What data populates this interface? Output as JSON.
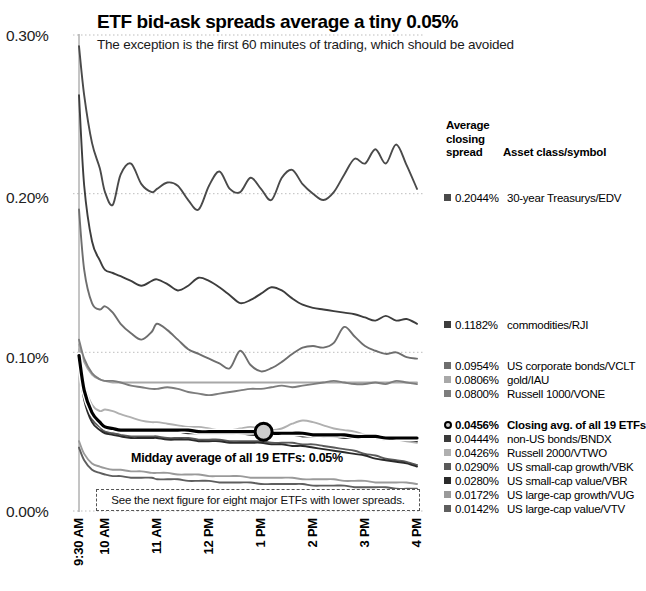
{
  "header": {
    "title": "ETF bid-ask spreads average a tiny 0.05%",
    "subtitle": "The exception is the first 60 minutes of trading, which should be avoided"
  },
  "annotations": {
    "midday": "Midday average of all 19 ETFs: 0.05%",
    "note": "See the next figure for eight major ETFs with lower spreads."
  },
  "legend": {
    "head_line1": "Average",
    "head_line2": "closing",
    "head_line3": "spread",
    "head_col2": "Asset class/symbol",
    "rows": [
      {
        "value": "0.2044%",
        "label": "30-year Treasurys/EDV",
        "color": "#4a4a4a",
        "marker": "square",
        "bold": false,
        "top": 191
      },
      {
        "value": "0.1182%",
        "label": "commodities/RJI",
        "color": "#3d3d3d",
        "marker": "square",
        "bold": false,
        "top": 318
      },
      {
        "value": "0.0954%",
        "label": "US corporate bonds/VCLT",
        "color": "#6e6e6e",
        "marker": "square",
        "bold": false,
        "top": 359
      },
      {
        "value": "0.0806%",
        "label": "gold/IAU",
        "color": "#a8a8a8",
        "marker": "square",
        "bold": false,
        "top": 373
      },
      {
        "value": "0.0800%",
        "label": "Russell 1000/VONE",
        "color": "#7d7d7d",
        "marker": "square",
        "bold": false,
        "top": 387
      },
      {
        "value": "0.0456%",
        "label": "Closing avg. of all 19 ETFs",
        "color": "#000000",
        "marker": "ring",
        "bold": true,
        "top": 418
      },
      {
        "value": "0.0444%",
        "label": "non-US bonds/BNDX",
        "color": "#3a3a3a",
        "marker": "square",
        "bold": false,
        "top": 432
      },
      {
        "value": "0.0426%",
        "label": "Russell 2000/VTWO",
        "color": "#b0b0b0",
        "marker": "square",
        "bold": false,
        "top": 446
      },
      {
        "value": "0.0290%",
        "label": "US small-cap growth/VBK",
        "color": "#5a5a5a",
        "marker": "square",
        "bold": false,
        "top": 460
      },
      {
        "value": "0.0280%",
        "label": "US small-cap value/VBR",
        "color": "#2a2a2a",
        "marker": "square",
        "bold": false,
        "top": 474
      },
      {
        "value": "0.0172%",
        "label": "US large-cap growth/VUG",
        "color": "#9a9a9a",
        "marker": "square",
        "bold": false,
        "top": 488
      },
      {
        "value": "0.0142%",
        "label": "US large-cap value/VTV",
        "color": "#5e5e5e",
        "marker": "square",
        "bold": false,
        "top": 502
      }
    ]
  },
  "chart_data": {
    "type": "line",
    "title": "ETF bid-ask spreads average a tiny 0.05%",
    "subtitle": "The exception is the first 60 minutes of trading, which should be avoided",
    "xlabel": "",
    "ylabel": "",
    "ylim": [
      0.0,
      0.3
    ],
    "yticks": [
      "0.00%",
      "0.10%",
      "0.20%",
      "0.30%"
    ],
    "ytick_values": [
      0.0,
      0.1,
      0.2,
      0.3
    ],
    "xticks": [
      "9:30 AM",
      "10 AM",
      "11 AM",
      "12 PM",
      "1 PM",
      "2 PM",
      "3 PM",
      "4 PM"
    ],
    "xtick_hours": [
      9.5,
      10,
      11,
      12,
      13,
      14,
      15,
      16
    ],
    "grid": "dotted-horizontal",
    "legend_position": "right",
    "x": [
      9.5,
      9.6,
      9.75,
      9.9,
      10.0,
      10.15,
      10.3,
      10.5,
      10.7,
      10.9,
      11.0,
      11.2,
      11.4,
      11.6,
      11.8,
      12.0,
      12.2,
      12.4,
      12.6,
      12.8,
      13.0,
      13.2,
      13.4,
      13.6,
      13.8,
      14.0,
      14.2,
      14.4,
      14.6,
      14.8,
      15.0,
      15.2,
      15.4,
      15.6,
      15.8,
      16.0
    ],
    "series": [
      {
        "name": "30-year Treasurys/EDV",
        "symbol": "EDV",
        "color": "#4a4a4a",
        "closing_avg": 0.2044,
        "values": [
          0.293,
          0.262,
          0.232,
          0.216,
          0.201,
          0.193,
          0.212,
          0.219,
          0.206,
          0.201,
          0.203,
          0.207,
          0.205,
          0.196,
          0.19,
          0.205,
          0.214,
          0.203,
          0.201,
          0.21,
          0.203,
          0.196,
          0.21,
          0.215,
          0.206,
          0.2,
          0.196,
          0.201,
          0.212,
          0.222,
          0.219,
          0.228,
          0.219,
          0.231,
          0.218,
          0.203
        ]
      },
      {
        "name": "commodities/RJI",
        "symbol": "RJI",
        "color": "#3d3d3d",
        "closing_avg": 0.1182,
        "values": [
          0.262,
          0.205,
          0.17,
          0.158,
          0.152,
          0.15,
          0.148,
          0.145,
          0.142,
          0.145,
          0.146,
          0.143,
          0.139,
          0.142,
          0.147,
          0.145,
          0.141,
          0.136,
          0.131,
          0.133,
          0.137,
          0.141,
          0.139,
          0.134,
          0.13,
          0.128,
          0.127,
          0.126,
          0.125,
          0.124,
          0.122,
          0.12,
          0.123,
          0.12,
          0.121,
          0.118
        ]
      },
      {
        "name": "US corporate bonds/VCLT",
        "symbol": "VCLT",
        "color": "#6e6e6e",
        "closing_avg": 0.0954,
        "values": [
          0.19,
          0.152,
          0.131,
          0.127,
          0.129,
          0.125,
          0.118,
          0.112,
          0.108,
          0.113,
          0.118,
          0.114,
          0.108,
          0.102,
          0.099,
          0.096,
          0.093,
          0.09,
          0.101,
          0.092,
          0.088,
          0.09,
          0.094,
          0.099,
          0.103,
          0.104,
          0.103,
          0.106,
          0.116,
          0.11,
          0.104,
          0.101,
          0.099,
          0.1,
          0.097,
          0.096
        ]
      },
      {
        "name": "gold/IAU",
        "symbol": "IAU",
        "color": "#a8a8a8",
        "closing_avg": 0.0806,
        "values": [
          0.105,
          0.094,
          0.086,
          0.083,
          0.082,
          0.081,
          0.081,
          0.081,
          0.081,
          0.081,
          0.081,
          0.081,
          0.081,
          0.081,
          0.081,
          0.081,
          0.081,
          0.081,
          0.081,
          0.081,
          0.081,
          0.081,
          0.081,
          0.081,
          0.081,
          0.081,
          0.081,
          0.081,
          0.081,
          0.081,
          0.081,
          0.081,
          0.081,
          0.081,
          0.081,
          0.081
        ]
      },
      {
        "name": "Russell 1000/VONE",
        "symbol": "VONE",
        "color": "#7d7d7d",
        "closing_avg": 0.08,
        "values": [
          0.108,
          0.096,
          0.087,
          0.083,
          0.082,
          0.082,
          0.081,
          0.079,
          0.078,
          0.077,
          0.077,
          0.078,
          0.077,
          0.075,
          0.074,
          0.073,
          0.074,
          0.075,
          0.076,
          0.077,
          0.077,
          0.078,
          0.079,
          0.078,
          0.079,
          0.08,
          0.081,
          0.082,
          0.081,
          0.08,
          0.08,
          0.081,
          0.08,
          0.082,
          0.081,
          0.08
        ]
      },
      {
        "name": "Closing avg. of all 19 ETFs",
        "symbol": "AVG19",
        "color": "#000000",
        "closing_avg": 0.0456,
        "values": [
          0.098,
          0.076,
          0.062,
          0.056,
          0.053,
          0.052,
          0.051,
          0.051,
          0.051,
          0.051,
          0.051,
          0.051,
          0.051,
          0.051,
          0.05,
          0.05,
          0.05,
          0.05,
          0.05,
          0.05,
          0.05,
          0.049,
          0.049,
          0.049,
          0.049,
          0.048,
          0.048,
          0.048,
          0.048,
          0.047,
          0.047,
          0.047,
          0.046,
          0.046,
          0.046,
          0.046
        ]
      },
      {
        "name": "non-US bonds/BNDX",
        "symbol": "BNDX",
        "color": "#3a3a3a",
        "closing_avg": 0.0444,
        "values": [
          0.096,
          0.074,
          0.06,
          0.055,
          0.052,
          0.051,
          0.05,
          0.05,
          0.05,
          0.05,
          0.05,
          0.05,
          0.05,
          0.049,
          0.049,
          0.049,
          0.049,
          0.049,
          0.049,
          0.048,
          0.048,
          0.048,
          0.048,
          0.048,
          0.047,
          0.047,
          0.047,
          0.047,
          0.046,
          0.046,
          0.046,
          0.046,
          0.045,
          0.045,
          0.045,
          0.044
        ]
      },
      {
        "name": "Russell 2000/VTWO",
        "symbol": "VTWO",
        "color": "#b0b0b0",
        "closing_avg": 0.0426,
        "values": [
          0.102,
          0.08,
          0.067,
          0.063,
          0.064,
          0.063,
          0.061,
          0.059,
          0.057,
          0.056,
          0.056,
          0.055,
          0.054,
          0.053,
          0.053,
          0.052,
          0.051,
          0.051,
          0.052,
          0.053,
          0.052,
          0.051,
          0.052,
          0.055,
          0.057,
          0.056,
          0.054,
          0.052,
          0.051,
          0.05,
          0.048,
          0.047,
          0.046,
          0.045,
          0.044,
          0.043
        ]
      },
      {
        "name": "US small-cap growth/VBK",
        "symbol": "VBK",
        "color": "#5a5a5a",
        "closing_avg": 0.029,
        "values": [
          0.094,
          0.072,
          0.058,
          0.053,
          0.05,
          0.049,
          0.048,
          0.047,
          0.047,
          0.047,
          0.047,
          0.046,
          0.046,
          0.046,
          0.045,
          0.045,
          0.045,
          0.044,
          0.044,
          0.044,
          0.044,
          0.043,
          0.043,
          0.043,
          0.042,
          0.042,
          0.041,
          0.04,
          0.039,
          0.038,
          0.036,
          0.035,
          0.033,
          0.032,
          0.031,
          0.029
        ]
      },
      {
        "name": "US small-cap value/VBR",
        "symbol": "VBR",
        "color": "#2a2a2a",
        "closing_avg": 0.028,
        "values": [
          0.092,
          0.07,
          0.056,
          0.051,
          0.049,
          0.048,
          0.047,
          0.046,
          0.046,
          0.046,
          0.046,
          0.045,
          0.045,
          0.045,
          0.044,
          0.044,
          0.044,
          0.043,
          0.043,
          0.043,
          0.043,
          0.042,
          0.042,
          0.041,
          0.041,
          0.04,
          0.039,
          0.038,
          0.037,
          0.036,
          0.035,
          0.033,
          0.032,
          0.031,
          0.03,
          0.028
        ]
      },
      {
        "name": "US large-cap growth/VUG",
        "symbol": "VUG",
        "color": "#9a9a9a",
        "closing_avg": 0.0172,
        "values": [
          0.044,
          0.036,
          0.03,
          0.028,
          0.027,
          0.026,
          0.026,
          0.025,
          0.025,
          0.024,
          0.024,
          0.024,
          0.023,
          0.023,
          0.023,
          0.022,
          0.022,
          0.022,
          0.022,
          0.021,
          0.021,
          0.021,
          0.021,
          0.021,
          0.02,
          0.02,
          0.02,
          0.02,
          0.019,
          0.019,
          0.019,
          0.018,
          0.018,
          0.018,
          0.018,
          0.017
        ]
      },
      {
        "name": "US large-cap value/VTV",
        "symbol": "VTV",
        "color": "#5e5e5e",
        "closing_avg": 0.0142,
        "values": [
          0.04,
          0.032,
          0.026,
          0.024,
          0.023,
          0.022,
          0.022,
          0.021,
          0.021,
          0.021,
          0.02,
          0.02,
          0.02,
          0.019,
          0.019,
          0.019,
          0.018,
          0.018,
          0.018,
          0.018,
          0.017,
          0.017,
          0.017,
          0.017,
          0.017,
          0.016,
          0.016,
          0.016,
          0.016,
          0.015,
          0.015,
          0.015,
          0.015,
          0.014,
          0.014,
          0.014
        ]
      }
    ],
    "marker_point": {
      "x": 13.05,
      "y": 0.05,
      "label": "Midday average of all 19 ETFs: 0.05%"
    }
  }
}
